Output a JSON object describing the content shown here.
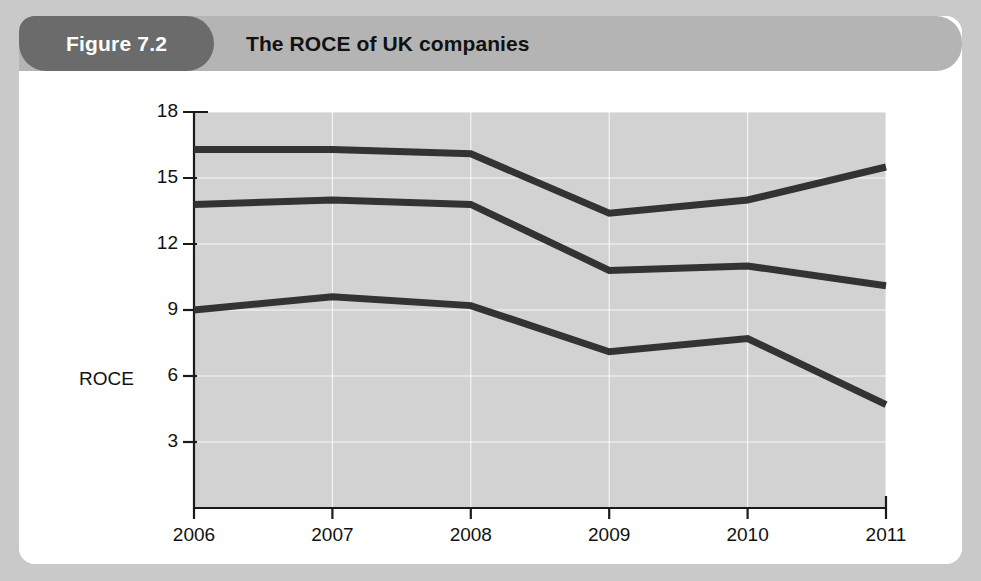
{
  "figure": {
    "badge_label": "Figure 7.2",
    "title": "The ROCE of UK companies"
  },
  "colors": {
    "frame": "#c9c9c9",
    "card": "#ffffff",
    "header_band": "#b4b4b4",
    "badge": "#6b6b6b",
    "plot_background": "#d2d2d2",
    "line": "#333333",
    "gridline": "#ffffff",
    "axis": "#1a1a1a",
    "text": "#111111"
  },
  "chart_data": {
    "type": "line",
    "title": "The ROCE of UK companies",
    "xlabel": "",
    "ylabel": "ROCE",
    "categories": [
      "2006",
      "2007",
      "2008",
      "2009",
      "2010",
      "2011"
    ],
    "x": [
      2006,
      2007,
      2008,
      2009,
      2010,
      2011
    ],
    "ylim": [
      0,
      18
    ],
    "yticks": [
      3,
      6,
      9,
      12,
      15,
      18
    ],
    "grid": true,
    "legend": "annotations-inline",
    "series": [
      {
        "name": "Service companies",
        "values": [
          16.3,
          16.3,
          16.1,
          13.4,
          14.0,
          15.5
        ]
      },
      {
        "name": "All non-financial companies",
        "values": [
          13.8,
          14.0,
          13.8,
          10.8,
          11.0,
          10.1
        ]
      },
      {
        "name": "Manufacturing companies",
        "values": [
          9.0,
          9.6,
          9.2,
          7.1,
          7.7,
          4.7
        ]
      }
    ],
    "annotations": [
      {
        "text": "All non-financial\ncompanies",
        "x_px": 298,
        "y_px": 239
      },
      {
        "text": "Service\ncompanies",
        "x_px": 646,
        "y_px": 144
      },
      {
        "text": "Manufacturing\ncompanies",
        "x_px": 680,
        "y_px": 366
      }
    ]
  },
  "axis": {
    "y_ticks": [
      "18",
      "15",
      "12",
      "9",
      "6",
      "3"
    ],
    "y_title": "ROCE",
    "x_ticks": [
      "2006",
      "2007",
      "2008",
      "2009",
      "2010",
      "2011"
    ]
  }
}
